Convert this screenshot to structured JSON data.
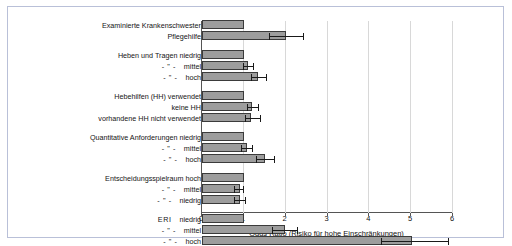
{
  "chart_data": {
    "type": "bar",
    "orientation": "horizontal",
    "title": "",
    "xlabel": "Odds Ratio (Risiko für hohe Einschränkungen)",
    "ylabel": "",
    "xlim": [
      0,
      6
    ],
    "xticks": [
      0,
      1,
      2,
      3,
      4,
      5,
      6
    ],
    "xticklabels": [
      "0",
      "1",
      "2",
      "3",
      "4",
      "5",
      "6"
    ],
    "grid": true,
    "legend": "none",
    "reference_line": 1,
    "groups": [
      {
        "name": "Berufsgruppe",
        "rows": [
          {
            "label": "Examinierte Krankenschwester",
            "prefix": "",
            "value": 1.0,
            "ci_low": null,
            "ci_high": null,
            "reference": true
          },
          {
            "label": "Pflegehilfe",
            "prefix": "",
            "value": 2.0,
            "ci_low": 1.62,
            "ci_high": 2.45,
            "reference": false
          }
        ]
      },
      {
        "name": "Heben und Tragen",
        "rows": [
          {
            "label": "Heben und Tragen niedrig",
            "prefix": "",
            "value": 1.0,
            "ci_low": null,
            "ci_high": null,
            "reference": true
          },
          {
            "label": "mittel",
            "prefix": "- \" -",
            "value": 1.11,
            "ci_low": 1.0,
            "ci_high": 1.25,
            "reference": false
          },
          {
            "label": "hoch",
            "prefix": "- \" -",
            "value": 1.33,
            "ci_low": 1.2,
            "ci_high": 1.55,
            "reference": false
          }
        ]
      },
      {
        "name": "Hebehilfen",
        "rows": [
          {
            "label": "Hebehilfen (HH) verwendet",
            "prefix": "",
            "value": 1.0,
            "ci_low": null,
            "ci_high": null,
            "reference": true
          },
          {
            "label": "keine HH",
            "prefix": "",
            "value": 1.2,
            "ci_low": 1.09,
            "ci_high": 1.36,
            "reference": false
          },
          {
            "label": "vorhandene HH nicht verwendet",
            "prefix": "",
            "value": 1.18,
            "ci_low": 1.05,
            "ci_high": 1.4,
            "reference": false
          }
        ]
      },
      {
        "name": "Quantitative Anforderungen",
        "rows": [
          {
            "label": "Quantitative Anforderungen niedrig",
            "prefix": "",
            "value": 1.0,
            "ci_low": null,
            "ci_high": null,
            "reference": true
          },
          {
            "label": "mittel",
            "prefix": "- \" -",
            "value": 1.07,
            "ci_low": 0.96,
            "ci_high": 1.22,
            "reference": false
          },
          {
            "label": "hoch",
            "prefix": "- \" -",
            "value": 1.5,
            "ci_low": 1.31,
            "ci_high": 1.75,
            "reference": false
          }
        ]
      },
      {
        "name": "Entscheidungsspielraum",
        "rows": [
          {
            "label": "Entscheidungsspielraum hoch",
            "prefix": "",
            "value": 1.0,
            "ci_low": null,
            "ci_high": null,
            "reference": true
          },
          {
            "label": "mittel",
            "prefix": "- \" -",
            "value": 0.9,
            "ci_low": 0.8,
            "ci_high": 1.01,
            "reference": false
          },
          {
            "label": "niedrig",
            "prefix": "- \" -",
            "value": 0.9,
            "ci_low": 0.79,
            "ci_high": 1.05,
            "reference": false
          }
        ]
      },
      {
        "name": "ERI",
        "rows": [
          {
            "label": "niedrig",
            "prefix": "ERI",
            "value": 1.0,
            "ci_low": null,
            "ci_high": null,
            "reference": true
          },
          {
            "label": "mittel",
            "prefix": "- \" -",
            "value": 1.99,
            "ci_low": 1.7,
            "ci_high": 2.3,
            "reference": false
          },
          {
            "label": "hoch",
            "prefix": "- \" -",
            "value": 5.02,
            "ci_low": 4.3,
            "ci_high": 5.9,
            "reference": false
          }
        ]
      }
    ]
  },
  "colors": {
    "bar_fill": "#9d9d9d",
    "bar_stroke": "#3b3b3b",
    "grid": "#d8d8d8",
    "axis": "#555555",
    "frame": "#b9c0d8",
    "text": "#141414",
    "background": "#ffffff"
  }
}
